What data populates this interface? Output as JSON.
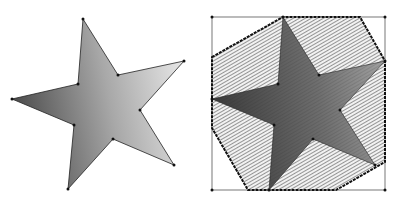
{
  "figure": {
    "width": 398,
    "height": 201,
    "background": "#ffffff"
  },
  "left_panel": {
    "label": "star-polygon",
    "star_vertices": [
      [
        83,
        19
      ],
      [
        118,
        75
      ],
      [
        184,
        61
      ],
      [
        140,
        110
      ],
      [
        174,
        165
      ],
      [
        113,
        139
      ],
      [
        68,
        189
      ],
      [
        74,
        125
      ],
      [
        12,
        99
      ],
      [
        78,
        84
      ]
    ],
    "fill_gradient": {
      "dark": "#4a4a4a",
      "light": "#e6e6e6"
    },
    "outline_color": "#222222",
    "vertex_dot_color": "#111111"
  },
  "right_panel": {
    "label": "star-with-convex-hull",
    "bounding_box": {
      "x": 212,
      "y": 17,
      "w": 173,
      "h": 173
    },
    "hull_vertices": [
      [
        212,
        57
      ],
      [
        283,
        17
      ],
      [
        360,
        17
      ],
      [
        385,
        61
      ],
      [
        385,
        162
      ],
      [
        336,
        190
      ],
      [
        248,
        190
      ],
      [
        212,
        128
      ]
    ],
    "star_vertices": [
      [
        283,
        17
      ],
      [
        319,
        75
      ],
      [
        385,
        61
      ],
      [
        340,
        110
      ],
      [
        375,
        165
      ],
      [
        313,
        139
      ],
      [
        269,
        190
      ],
      [
        274,
        125
      ],
      [
        212,
        99
      ],
      [
        278,
        84
      ]
    ],
    "hatch_color": "#555555",
    "star_fill_gradient": {
      "dark": "#3a3a3a",
      "light": "#9a9a9a"
    },
    "hull_edge_color": "#111111",
    "box_color": "#555555"
  }
}
